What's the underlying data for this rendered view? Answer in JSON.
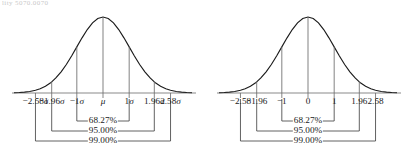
{
  "page": {
    "top_fragment": "lity 5070.0070"
  },
  "chart_data": [
    {
      "type": "line",
      "title": "",
      "subtitle": "",
      "xlabel": "",
      "ylabel": "",
      "panel": "left",
      "distribution": "normal",
      "center_label": "μ",
      "units": "sigma",
      "grid": false,
      "legend": "none",
      "xlim": [
        -3.4,
        3.4
      ],
      "ylim": [
        0,
        1
      ],
      "x": [
        -3.4,
        -3.2,
        -3.0,
        -2.8,
        -2.58,
        -2.4,
        -2.2,
        -2.0,
        -1.96,
        -1.8,
        -1.6,
        -1.4,
        -1.2,
        -1.0,
        -0.8,
        -0.6,
        -0.4,
        -0.2,
        0,
        0.2,
        0.4,
        0.6,
        0.8,
        1.0,
        1.2,
        1.4,
        1.6,
        1.8,
        1.96,
        2.0,
        2.2,
        2.4,
        2.58,
        2.8,
        3.0,
        3.2,
        3.4
      ],
      "y": [
        0.003,
        0.006,
        0.011,
        0.02,
        0.036,
        0.056,
        0.089,
        0.135,
        0.146,
        0.198,
        0.278,
        0.375,
        0.487,
        0.607,
        0.726,
        0.835,
        0.923,
        0.98,
        1.0,
        0.98,
        0.923,
        0.835,
        0.726,
        0.607,
        0.487,
        0.375,
        0.278,
        0.198,
        0.146,
        0.135,
        0.089,
        0.056,
        0.036,
        0.02,
        0.011,
        0.006,
        0.003
      ],
      "tick_values": [
        -2.58,
        -1.96,
        -1,
        0,
        1,
        1.96,
        2.58
      ],
      "tick_labels": [
        "−2.58σ",
        "−1.96σ",
        "−1σ",
        "μ",
        "1σ",
        "1.96σ",
        "2.58σ"
      ],
      "vertical_lines_at": [
        -1.96,
        -1,
        0,
        1,
        1.96
      ],
      "annotations": [
        {
          "label": "68.27%",
          "from": -1,
          "to": 1,
          "row": 0
        },
        {
          "label": "95.00%",
          "from": -1.96,
          "to": 1.96,
          "row": 1
        },
        {
          "label": "99.00%",
          "from": -2.58,
          "to": 2.58,
          "row": 2
        }
      ]
    },
    {
      "type": "line",
      "title": "",
      "subtitle": "",
      "xlabel": "",
      "ylabel": "",
      "panel": "right",
      "distribution": "normal",
      "center_label": "0",
      "units": "z-score",
      "grid": false,
      "legend": "none",
      "xlim": [
        -3.4,
        3.4
      ],
      "ylim": [
        0,
        1
      ],
      "x": [
        -3.4,
        -3.2,
        -3.0,
        -2.8,
        -2.58,
        -2.4,
        -2.2,
        -2.0,
        -1.96,
        -1.8,
        -1.6,
        -1.4,
        -1.2,
        -1.0,
        -0.8,
        -0.6,
        -0.4,
        -0.2,
        0,
        0.2,
        0.4,
        0.6,
        0.8,
        1.0,
        1.2,
        1.4,
        1.6,
        1.8,
        1.96,
        2.0,
        2.2,
        2.4,
        2.58,
        2.8,
        3.0,
        3.2,
        3.4
      ],
      "y": [
        0.003,
        0.006,
        0.011,
        0.02,
        0.036,
        0.056,
        0.089,
        0.135,
        0.146,
        0.198,
        0.278,
        0.375,
        0.487,
        0.607,
        0.726,
        0.835,
        0.923,
        0.98,
        1.0,
        0.98,
        0.923,
        0.835,
        0.726,
        0.607,
        0.487,
        0.375,
        0.278,
        0.198,
        0.146,
        0.135,
        0.089,
        0.056,
        0.036,
        0.02,
        0.011,
        0.006,
        0.003
      ],
      "tick_values": [
        -2.58,
        -1.96,
        -1,
        0,
        1,
        1.96,
        2.58
      ],
      "tick_labels": [
        "−2.58",
        "−1.96",
        "−1",
        "0",
        "1",
        "1.96",
        "2.58"
      ],
      "vertical_lines_at": [
        -1.96,
        -1,
        0,
        1,
        1.96
      ],
      "annotations": [
        {
          "label": "68.27%",
          "from": -1,
          "to": 1,
          "row": 0
        },
        {
          "label": "95.00%",
          "from": -1.96,
          "to": 1.96,
          "row": 1
        },
        {
          "label": "99.00%",
          "from": -2.58,
          "to": 2.58,
          "row": 2
        }
      ]
    }
  ],
  "colors": {
    "curve": "#1b1b1b",
    "axis": "#8a8a8a",
    "bracket": "#3a3a3a",
    "text": "#1a1a1a",
    "background": "#ffffff"
  }
}
